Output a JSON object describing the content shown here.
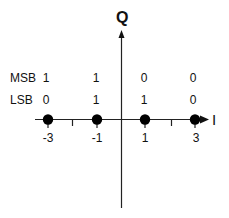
{
  "diagram": {
    "axes": {
      "vertical_label": "Q",
      "horizontal_label": "I"
    },
    "rows": {
      "msb_label": "MSB",
      "lsb_label": "LSB"
    },
    "points": [
      {
        "i": -3,
        "label": "-3",
        "msb": "1",
        "lsb": "0"
      },
      {
        "i": -1,
        "label": "-1",
        "msb": "1",
        "lsb": "1"
      },
      {
        "i": 1,
        "label": "1",
        "msb": "0",
        "lsb": "1"
      },
      {
        "i": 3,
        "label": "3",
        "msb": "0",
        "lsb": "0"
      }
    ],
    "colors": {
      "line": "#111111",
      "point": "#000000",
      "background": "#ffffff"
    }
  }
}
